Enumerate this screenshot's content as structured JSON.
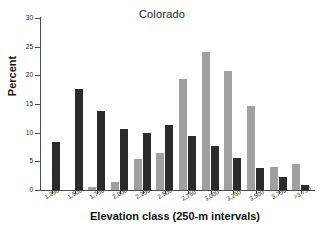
{
  "chart_data": {
    "type": "bar",
    "title": "Colorado",
    "xlabel": "Elevation class (250-m intervals)",
    "ylabel": "Percent",
    "ylim": [
      0,
      30
    ],
    "yticks": [
      0,
      5,
      10,
      15,
      20,
      25,
      30
    ],
    "grid": false,
    "legend": "none",
    "categories": [
      "1,250",
      "1,500",
      "1,750",
      "2,000",
      "2,250",
      "2,500",
      "2,750",
      "3,000",
      "3,250",
      "3,500",
      "3,750",
      ">3,750"
    ],
    "category_markers": [
      "",
      "",
      "",
      "",
      "",
      "",
      "*",
      "*",
      "*",
      "*",
      "",
      ""
    ],
    "series": [
      {
        "name": "gray-series",
        "color": "#a0a0a0",
        "values": [
          0,
          0,
          0.5,
          1.4,
          5.4,
          6.4,
          19.3,
          24.1,
          20.8,
          14.6,
          4.1,
          4.6
        ]
      },
      {
        "name": "dark-series",
        "color": "#2b2b2b",
        "values": [
          8.3,
          17.7,
          13.7,
          10.6,
          9.9,
          11.4,
          9.4,
          7.6,
          5.6,
          3.8,
          2.3,
          0.8
        ]
      }
    ]
  }
}
